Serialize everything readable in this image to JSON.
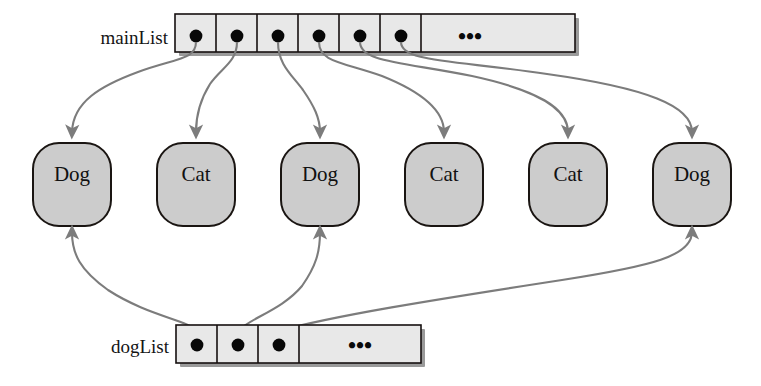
{
  "diagram": {
    "type": "object-reference-diagram",
    "colors": {
      "node_fill": "#cccccc",
      "node_stroke": "#1a1512",
      "cell_fill": "#e8e8e8",
      "cell_stroke": "#16100f",
      "arrow": "#7c7c7c",
      "text": "#111111",
      "background": "#ffffff"
    }
  },
  "main_list": {
    "label": "mainList",
    "label_x": 132,
    "label_y": 44,
    "array": {
      "x": 175,
      "y": 14,
      "width": 400,
      "height": 38,
      "cell_width": 41,
      "pointer_cell_count": 6,
      "ellipsis": "•••",
      "ellipsis_x": 470,
      "cells": [
        {
          "index": 0,
          "kind": "pointer",
          "dot_cx": 196,
          "dot_cy": 38,
          "target": "node-0"
        },
        {
          "index": 1,
          "kind": "pointer",
          "dot_cx": 237,
          "dot_cy": 38,
          "target": "node-1"
        },
        {
          "index": 2,
          "kind": "pointer",
          "dot_cx": 278,
          "dot_cy": 38,
          "target": "node-2"
        },
        {
          "index": 3,
          "kind": "pointer",
          "dot_cx": 319,
          "dot_cy": 38,
          "target": "node-3"
        },
        {
          "index": 4,
          "kind": "pointer",
          "dot_cx": 360,
          "dot_cy": 38,
          "target": "node-4"
        },
        {
          "index": 5,
          "kind": "pointer",
          "dot_cx": 401,
          "dot_cy": 38,
          "target": "node-5"
        },
        {
          "index": 6,
          "kind": "ellipsis",
          "label": "•••"
        }
      ]
    }
  },
  "dog_list": {
    "label": "dogList",
    "label_x": 105,
    "label_y": 347,
    "array": {
      "x": 176,
      "y": 325,
      "width": 245,
      "height": 38,
      "cell_width": 41,
      "pointer_cell_count": 3,
      "ellipsis": "•••",
      "ellipsis_x": 360,
      "cells": [
        {
          "index": 0,
          "kind": "pointer",
          "dot_cx": 197,
          "dot_cy": 347,
          "target": "node-0"
        },
        {
          "index": 1,
          "kind": "pointer",
          "dot_cx": 238,
          "dot_cy": 347,
          "target": "node-2"
        },
        {
          "index": 2,
          "kind": "pointer",
          "dot_cx": 279,
          "dot_cy": 347,
          "target": "node-5"
        },
        {
          "index": 3,
          "kind": "ellipsis",
          "label": "•••"
        }
      ]
    }
  },
  "objects": {
    "row_y": 143,
    "node_width": 78,
    "node_height": 83,
    "corner_radius": 26,
    "items": [
      {
        "id": "node-0",
        "label": "Dog",
        "cx": 72,
        "x": 33
      },
      {
        "id": "node-1",
        "label": "Cat",
        "cx": 196,
        "x": 157
      },
      {
        "id": "node-2",
        "label": "Dog",
        "cx": 320,
        "x": 281
      },
      {
        "id": "node-3",
        "label": "Cat",
        "cx": 444,
        "x": 405
      },
      {
        "id": "node-4",
        "label": "Cat",
        "cx": 568,
        "x": 529
      },
      {
        "id": "node-5",
        "label": "Dog",
        "cx": 692,
        "x": 653
      }
    ]
  },
  "edges": {
    "from_main_list": [
      {
        "from_cell": 0,
        "to_node": "node-0",
        "path": "M 196 44 C 196 62, 180 58, 140 72 C 100 86, 72 100, 72 135"
      },
      {
        "from_cell": 1,
        "to_node": "node-1",
        "path": "M 237 44 C 237 64, 222 66, 210 82 C 200 98, 196 112, 196 135"
      },
      {
        "from_cell": 2,
        "to_node": "node-2",
        "path": "M 278 44 C 278 66, 290 72, 302 88 C 314 104, 320 116, 320 135"
      },
      {
        "from_cell": 3,
        "to_node": "node-3",
        "path": "M 319 44 C 319 64, 340 62, 380 76 C 420 92, 444 108, 444 135"
      },
      {
        "from_cell": 4,
        "to_node": "node-4",
        "path": "M 360 44 C 360 64, 400 62, 470 76 C 535 90, 568 106, 568 135"
      },
      {
        "from_cell": 5,
        "to_node": "node-5",
        "path": "M 401 44 C 401 64, 450 60, 545 74 C 645 88, 692 104, 692 135"
      }
    ],
    "from_dog_list": [
      {
        "from_cell": 0,
        "to_node": "node-0",
        "path": "M 197 333 C 190 322, 150 318, 110 292 C 80 272, 72 256, 72 238"
      },
      {
        "from_cell": 1,
        "to_node": "node-2",
        "path": "M 238 333 C 248 320, 280 312, 300 288 C 315 268, 320 254, 320 238"
      },
      {
        "from_cell": 2,
        "to_node": "node-5",
        "path": "M 279 333 C 330 318, 430 302, 560 282 C 650 268, 692 258, 692 238"
      }
    ]
  }
}
